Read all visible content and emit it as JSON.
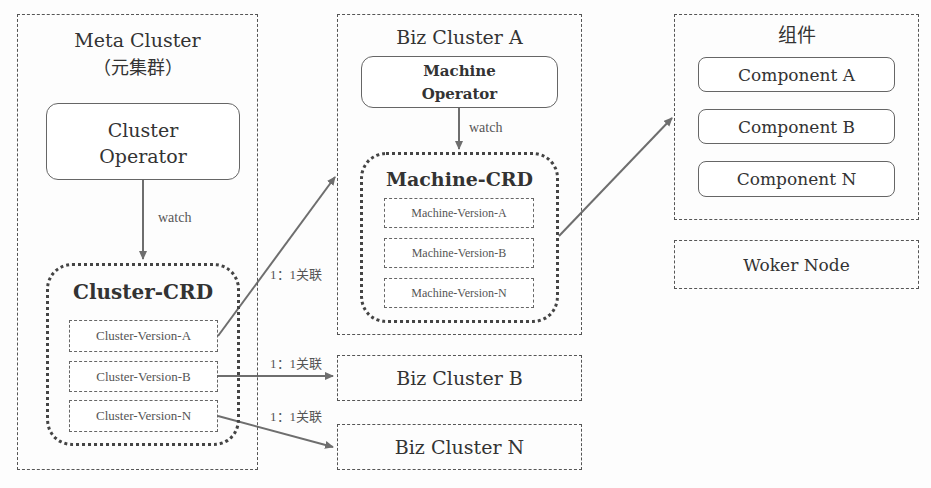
{
  "meta_cluster": {
    "title": "Meta Cluster",
    "subtitle": "（元集群）",
    "operator": {
      "line1": "Cluster",
      "line2": "Operator"
    },
    "watch_label": "watch",
    "crd": {
      "title": "Cluster-CRD",
      "versions": [
        "Cluster-Version-A",
        "Cluster-Version-B",
        "Cluster-Version-N"
      ]
    }
  },
  "biz_cluster_a": {
    "title": "Biz Cluster A",
    "operator": {
      "line1": "Machine",
      "line2": "Operator"
    },
    "watch_label": "watch",
    "crd": {
      "title": "Machine-CRD",
      "versions": [
        "Machine-Version-A",
        "Machine-Version-B",
        "Machine-Version-N"
      ]
    }
  },
  "biz_cluster_b": {
    "title": "Biz Cluster B"
  },
  "biz_cluster_n": {
    "title": "Biz Cluster N"
  },
  "components": {
    "title": "组件",
    "items": [
      "Component A",
      "Component B",
      "Component N"
    ]
  },
  "worker_node": {
    "title": "Woker Node"
  },
  "relations": {
    "a": "1：1关联",
    "b": "1：1关联",
    "n": "1：1关联"
  },
  "colors": {
    "line": "#6e6e6e",
    "border": "#555555",
    "text": "#333333"
  }
}
